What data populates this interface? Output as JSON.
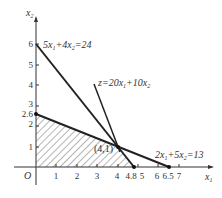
{
  "diagram": {
    "axes": {
      "x_label": "x",
      "x_sub": "1",
      "y_label": "x",
      "y_sub": "2",
      "origin_label": "O",
      "x_ticks": [
        "1",
        "2",
        "3",
        "4",
        "4.8",
        "5",
        "6",
        "6.5",
        "7"
      ],
      "y_ticks": [
        "1",
        "2",
        "2.6",
        "3",
        "4",
        "5",
        "6"
      ]
    },
    "lines": [
      {
        "name": "constraint-1",
        "label": "5x1+4x2=24",
        "from": [
          0,
          6
        ],
        "to": [
          4.8,
          0
        ]
      },
      {
        "name": "constraint-2",
        "label": "2x1+5x2=13",
        "from": [
          0,
          2.6
        ],
        "to": [
          6.5,
          0
        ]
      },
      {
        "name": "objective",
        "label": "z=20x1+10x2"
      }
    ],
    "point_label": "(4,1)",
    "feasible_region": [
      [
        0,
        0
      ],
      [
        0,
        2.6
      ],
      [
        4,
        1
      ],
      [
        4.8,
        0
      ]
    ],
    "colors": {
      "line": "#222222",
      "text": "#333333"
    }
  }
}
